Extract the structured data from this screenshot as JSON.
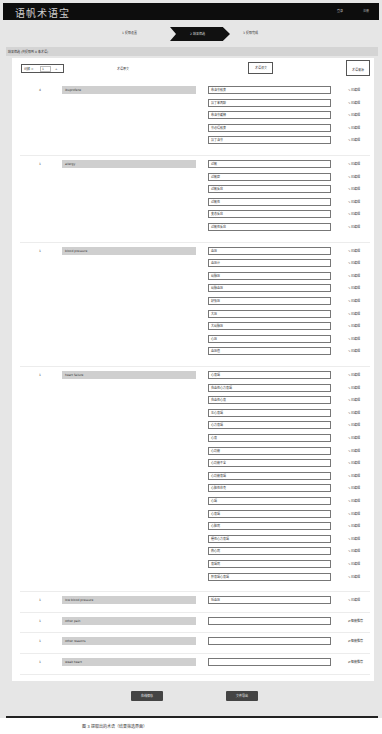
{
  "header": {
    "logo": "语帆术语宝",
    "links": [
      "登录",
      "注册"
    ]
  },
  "steps": [
    {
      "label": "1 提取设置"
    },
    {
      "label": "2 结果筛选",
      "active": true
    },
    {
      "label": "3 提取完成"
    }
  ],
  "section": {
    "title": "结果筛选 (共提取到 8 条术语)"
  },
  "toolbar": {
    "freq_label": "词频 =",
    "freq_value": "1",
    "freq_plus": "+",
    "source_header": "术语原文",
    "target_header": "术语译文",
    "source_from_header": "术语来源"
  },
  "rows": [
    {
      "count": "4",
      "source": "ibuprofene",
      "targets": [
        "布洛芬胶囊",
        "异丁苯丙酸",
        "布洛芬缓释",
        "芬必得胶囊",
        "异丁洛芬"
      ],
      "action": "已编辑"
    },
    {
      "count": "1",
      "source": "allergy",
      "targets": [
        "过敏",
        "过敏症",
        "过敏反应",
        "过敏性",
        "变态反应",
        "过敏性反应"
      ],
      "action": "已编辑"
    },
    {
      "count": "1",
      "source": "blood pressure",
      "targets": [
        "血压",
        "血压计",
        "动脉压",
        "动脉血压",
        "舒张压",
        "大压",
        "大动脉压",
        "心压",
        "血压值"
      ],
      "action": "已编辑"
    },
    {
      "count": "1",
      "source": "heart failure",
      "targets": [
        "心衰竭",
        "充血性心力衰竭",
        "充血性心衰",
        "左心衰竭",
        "心力衰竭",
        "心衰",
        "心功能",
        "心功能不全",
        "心功能衰竭",
        "心脏性休克",
        "心竭",
        "心衰竭",
        "心脏病",
        "慢性心力衰竭",
        "热心病",
        "衰竭病",
        "肝衰竭心衰竭"
      ],
      "action": "已编辑"
    },
    {
      "count": "1",
      "source": "low blood pressure",
      "targets": [
        "低血压"
      ],
      "action": "已编辑"
    },
    {
      "count": "1",
      "source": "other pain",
      "targets": [
        ""
      ],
      "action": "智能推荐"
    },
    {
      "count": "1",
      "source": "other reasons",
      "targets": [
        ""
      ],
      "action": "智能推荐"
    },
    {
      "count": "1",
      "source": "weak heart",
      "targets": [
        ""
      ],
      "action": "智能推荐"
    }
  ],
  "icons": {
    "edited": "pencil-icon",
    "recommend": "arrows-icon"
  },
  "footer": {
    "save_label": "在线保存",
    "export_label": "文件导出"
  },
  "caption": "图 3   提取出的术语（结果筛选界面）"
}
